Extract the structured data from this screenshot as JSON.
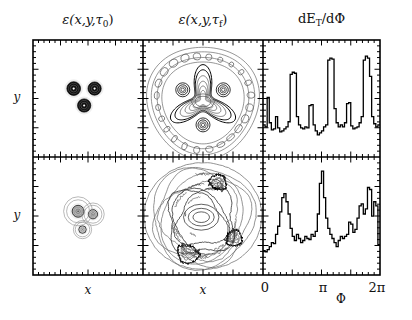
{
  "figure": {
    "kind": "multi-panel-physics-figure",
    "rows": 2,
    "cols": 3,
    "background": "#ffffff",
    "line_color": "#000000"
  },
  "columns": [
    {
      "id": "eps-tau0",
      "title_main": "ε(x,y,τ",
      "title_sub": "0",
      "title_close": ")",
      "xlabel": "x"
    },
    {
      "id": "eps-tauf",
      "title_main": "ε(x,y,τ",
      "title_sub": "f",
      "title_close": ")",
      "xlabel": "x"
    },
    {
      "id": "det-dphi",
      "title_main": "dE",
      "title_sub": "T",
      "title_close": "/dΦ",
      "xlabel": "Φ"
    }
  ],
  "rows": [
    {
      "id": "row-top",
      "ylabel": "y"
    },
    {
      "id": "row-bottom",
      "ylabel": "y"
    }
  ],
  "phi_axis": {
    "ticks": [
      "0",
      "π",
      "2π"
    ],
    "label": "Φ",
    "range": [
      0,
      6.283185
    ]
  },
  "chart_data": [
    {
      "type": "scatter",
      "id": "panel-r1c1",
      "title": "ε(x,y,τ_0)",
      "xlabel": "x",
      "ylabel": "y",
      "grid": false,
      "xlim": [
        -1,
        1
      ],
      "ylim": [
        -1,
        1
      ],
      "description": "three compact high-density hot spots in triangular arrangement, dark filled contour rings",
      "blobs": [
        {
          "cx": -0.26,
          "cy": 0.17,
          "r": 0.155,
          "fill": "#101010",
          "rings": 4
        },
        {
          "cx": 0.12,
          "cy": 0.17,
          "r": 0.15,
          "fill": "#101010",
          "rings": 4
        },
        {
          "cx": -0.07,
          "cy": -0.12,
          "r": 0.15,
          "fill": "#101010",
          "rings": 4
        }
      ]
    },
    {
      "type": "scatter",
      "id": "panel-r2c1",
      "title": "ε(x,y,τ_0)",
      "xlabel": "x",
      "ylabel": "y",
      "grid": false,
      "xlim": [
        -1,
        1
      ],
      "ylim": [
        -1,
        1
      ],
      "description": "three merged lower-density hot spots, light grey contour rings overlapping",
      "blobs": [
        {
          "cx": -0.18,
          "cy": 0.08,
          "r": 0.135,
          "fill": "#b4b4b4",
          "rings": 3
        },
        {
          "cx": 0.09,
          "cy": 0.03,
          "r": 0.105,
          "fill": "#c8c8c8",
          "rings": 3
        },
        {
          "cx": -0.1,
          "cy": -0.23,
          "r": 0.085,
          "fill": "#e2e2e2",
          "rings": 2
        }
      ]
    },
    {
      "type": "contour",
      "id": "panel-r1c2",
      "title": "ε(x,y,τ_f)",
      "xlabel": "x",
      "ylabel": "y",
      "grid": false,
      "xlim": [
        -1,
        1
      ],
      "ylim": [
        -1,
        1
      ],
      "description": "threefold-symmetric expanded contour pattern with triangular shock front and outer ring of small islands"
    },
    {
      "type": "contour",
      "id": "panel-r2c2",
      "title": "ε(x,y,τ_f)",
      "xlabel": "x",
      "ylabel": "y",
      "grid": false,
      "xlim": [
        -1,
        1
      ],
      "ylim": [
        -1,
        1
      ],
      "description": "irregular asymmetric expanded contour pattern, wrinkled shock fronts, nested closed contours"
    },
    {
      "type": "line",
      "id": "panel-r1c3",
      "title": "dE_T/dΦ",
      "xlabel": "Φ",
      "ylabel": "dE_T/dΦ",
      "grid": false,
      "xlim": [
        0,
        6.283185
      ],
      "ylim": [
        0,
        1
      ],
      "step": true,
      "xticks": [
        0,
        3.141593,
        6.283185
      ],
      "xticklabels": [
        "0",
        "π",
        "2π"
      ],
      "values": [
        0.22,
        0.2,
        0.49,
        0.24,
        0.17,
        0.18,
        0.3,
        0.19,
        0.15,
        0.16,
        0.18,
        0.2,
        0.25,
        0.72,
        0.74,
        0.73,
        0.3,
        0.22,
        0.19,
        0.18,
        0.2,
        0.19,
        0.41,
        0.42,
        0.22,
        0.16,
        0.12,
        0.14,
        0.16,
        0.2,
        0.22,
        0.86,
        0.88,
        0.87,
        0.38,
        0.24,
        0.2,
        0.22,
        0.2,
        0.24,
        0.43,
        0.44,
        0.21,
        0.18,
        0.19,
        0.2,
        0.24,
        0.3,
        0.86,
        0.9,
        0.88,
        0.7,
        0.3,
        0.23,
        0.2,
        0.22
      ]
    },
    {
      "type": "line",
      "id": "panel-r2c3",
      "title": "dE_T/dΦ",
      "xlabel": "Φ",
      "ylabel": "dE_T/dΦ",
      "grid": false,
      "xlim": [
        0,
        6.283185
      ],
      "ylim": [
        0,
        1
      ],
      "step": true,
      "xticks": [
        0,
        3.141593,
        6.283185
      ],
      "xticklabels": [
        "0",
        "π",
        "2π"
      ],
      "values": [
        0.14,
        0.13,
        0.15,
        0.18,
        0.22,
        0.21,
        0.3,
        0.38,
        0.52,
        0.66,
        0.7,
        0.62,
        0.5,
        0.36,
        0.28,
        0.24,
        0.3,
        0.26,
        0.22,
        0.24,
        0.28,
        0.26,
        0.25,
        0.3,
        0.28,
        0.33,
        0.5,
        0.8,
        0.92,
        0.66,
        0.46,
        0.36,
        0.3,
        0.26,
        0.22,
        0.18,
        0.24,
        0.28,
        0.26,
        0.28,
        0.3,
        0.42,
        0.4,
        0.32,
        0.35,
        0.46,
        0.58,
        0.6,
        0.5,
        0.55,
        0.76,
        0.74,
        0.48,
        0.62,
        0.58,
        0.2
      ]
    }
  ]
}
